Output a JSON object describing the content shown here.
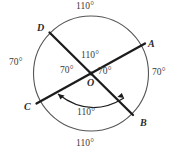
{
  "figure": {
    "type": "geometry-diagram",
    "shape": "circle with two intersecting diameters",
    "center_point_label": "O",
    "circle": {
      "cx": 91,
      "cy": 73.5,
      "r": 57.5
    },
    "points": [
      {
        "name": "A",
        "label": "A",
        "x": 151,
        "y": 45,
        "angle_deg": 25
      },
      {
        "name": "B",
        "label": "B",
        "x": 141,
        "y": 122,
        "angle_deg": -55
      },
      {
        "name": "C",
        "label": "C",
        "x": 25,
        "y": 106,
        "angle_deg": 205
      },
      {
        "name": "D",
        "label": "D",
        "x": 38,
        "y": 27,
        "angle_deg": 125
      }
    ],
    "chords": [
      {
        "name": "chord-AC",
        "from": "C",
        "to": "A"
      },
      {
        "name": "chord-DB",
        "from": "D",
        "to": "B"
      }
    ],
    "arc_labels": [
      {
        "name": "arc-DA-top",
        "value": "110°",
        "x": 76,
        "y": 2
      },
      {
        "name": "arc-CD-left",
        "value": "70°",
        "x": 9,
        "y": 58
      },
      {
        "name": "arc-AB-right",
        "value": "70°",
        "x": 152,
        "y": 68
      },
      {
        "name": "arc-CB-bottom",
        "value": "110°",
        "x": 76,
        "y": 139
      }
    ],
    "center_angle_labels": [
      {
        "name": "angle-DOA-top",
        "value": "110°",
        "x": 81,
        "y": 51
      },
      {
        "name": "angle-COD-left",
        "value": "70°",
        "x": 60,
        "y": 66
      },
      {
        "name": "angle-AOB-right",
        "value": "70°",
        "x": 98,
        "y": 67
      }
    ],
    "arrow_arc": {
      "name": "angle-COB-arc",
      "value": "110°",
      "label_x": 77,
      "label_y": 108,
      "description": "double-headed arc from chord OC to chord OB"
    },
    "colors": {
      "stroke": "#1c1c1c",
      "circle_stroke": "#555555",
      "text": "#3a3a3a",
      "background": "#ffffff"
    }
  }
}
